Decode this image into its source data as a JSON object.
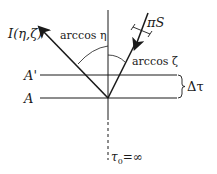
{
  "diagram": {
    "labels": {
      "intensity": "I(η,ζ)",
      "arccos_eta": "arccos η",
      "flux": "πS",
      "arccos_zeta": "arccos ζ",
      "level_a_prime": "A'",
      "level_a": "A",
      "delta_tau": "Δτ",
      "tau_zero": "τ",
      "tau_zero_sub": "0",
      "tau_zero_value": "=∞"
    },
    "colors": {
      "ink": "#1a1a1a",
      "background": "#ffffff"
    }
  }
}
